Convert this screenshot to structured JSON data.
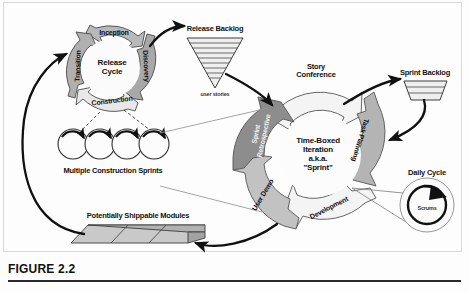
{
  "figure": {
    "caption": "FIGURE 2.2"
  },
  "release_cycle": {
    "center_label_line1": "Release",
    "center_label_line2": "Cycle",
    "phases": [
      {
        "label": "Inception",
        "position": "top",
        "fill": "#b9b9b9"
      },
      {
        "label": "Discovery",
        "position": "right",
        "fill": "#a8a8a8"
      },
      {
        "label": "Construction",
        "position": "bottom",
        "fill": "#e8e8e8"
      },
      {
        "label": "Transition",
        "position": "left",
        "fill": "#b0b0b0"
      }
    ]
  },
  "sprint_cycle": {
    "center_label_lines": [
      "Time-Boxed",
      "Iteration",
      "a.k.a.",
      "\"Sprint\""
    ],
    "phases": [
      {
        "label": "Story Conference",
        "position": "top",
        "fill": "#f4f4f4"
      },
      {
        "label": "Task Planning",
        "position": "upper-right",
        "fill": "#b4b4b4"
      },
      {
        "label": "Development",
        "position": "lower-right",
        "fill": "#f4f4f4"
      },
      {
        "label": "User Demo",
        "position": "lower-left",
        "fill": "#c2c2c2"
      },
      {
        "label": "Sprint Retrospective",
        "position": "upper-left",
        "fill": "#8d8d8d"
      }
    ]
  },
  "artifacts": {
    "release_backlog": {
      "title": "Release Backlog",
      "sublabel": "user stories",
      "shape": "inverted-striped-funnel"
    },
    "sprint_backlog": {
      "title": "Sprint Backlog",
      "shape": "striped-trapezoid"
    },
    "construction_sprints": {
      "title": "Multiple Construction Sprints",
      "circle_count": 4
    },
    "shippable_modules": {
      "title": "Potentially Shippable Modules",
      "block_count": 3
    },
    "daily_cycle": {
      "title": "Daily Cycle",
      "inner_label": "Scrums"
    }
  },
  "colors": {
    "stroke": "#3a3a3a",
    "arrow_black": "#111111",
    "fill_light": "#f2f2f2",
    "fill_mid": "#bcbcbc",
    "fill_dark": "#8d8d8d",
    "background": "#fdfdfd"
  }
}
